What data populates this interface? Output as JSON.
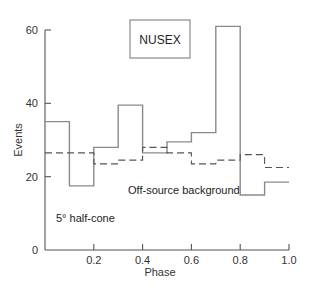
{
  "chart_data": {
    "type": "bar",
    "subtype": "step-histogram",
    "title": "NUSEX",
    "xlabel": "Phase",
    "ylabel": "Events",
    "xlim": [
      0,
      1.0
    ],
    "ylim": [
      0,
      60
    ],
    "xticks": [
      "0.2",
      "0.4",
      "0.6",
      "0.8",
      "1.0"
    ],
    "xtick_values": [
      0.2,
      0.4,
      0.6,
      0.8,
      1.0
    ],
    "yticks": [
      "0",
      "20",
      "40",
      "60"
    ],
    "ytick_values": [
      0,
      20,
      40,
      60
    ],
    "grid": false,
    "bin_edges": [
      0,
      0.1,
      0.2,
      0.3,
      0.4,
      0.5,
      0.6,
      0.7,
      0.8,
      0.9,
      1.0
    ],
    "categories": [
      "0.0-0.1",
      "0.1-0.2",
      "0.2-0.3",
      "0.3-0.4",
      "0.4-0.5",
      "0.5-0.6",
      "0.6-0.7",
      "0.7-0.8",
      "0.8-0.9",
      "0.9-1.0"
    ],
    "series": [
      {
        "name": "On-source (5° half-cone)",
        "style": "solid",
        "values": [
          35,
          17.5,
          28,
          39.5,
          26.5,
          29.5,
          32,
          61,
          15,
          18.5
        ]
      },
      {
        "name": "Off-source background",
        "style": "dashed",
        "values": [
          26.5,
          26.5,
          23.5,
          24.5,
          28,
          26.5,
          23.5,
          24.5,
          26,
          22.5
        ]
      }
    ],
    "annotations": [
      "NUSEX",
      "Off-source background",
      "5° half-cone"
    ]
  },
  "labels": {
    "title_box": "NUSEX",
    "background_label": "Off-source background",
    "cone_label": "5° half-cone",
    "xlabel": "Phase",
    "ylabel": "Events"
  },
  "colors": {
    "solid_line": "#8a8a8a",
    "dashed_line": "#555555",
    "axis": "#555555"
  }
}
